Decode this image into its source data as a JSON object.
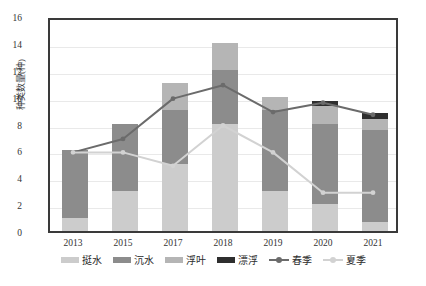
{
  "chart_data": {
    "type": "bar",
    "title": "",
    "xlabel": "",
    "ylabel": "种类数量(种)",
    "categories": [
      "2013",
      "2015",
      "2017",
      "2018",
      "2019",
      "2020",
      "2021"
    ],
    "ylim": [
      0,
      16
    ],
    "ytick_step": 2,
    "yticks": [
      "16",
      "14",
      "12",
      "10",
      "8",
      "6",
      "4",
      "2",
      "0"
    ],
    "grid": true,
    "legend_position": "bottom",
    "stacked": true,
    "series": [
      {
        "name": "挺水",
        "kind": "bar",
        "color": "#cccccc",
        "values": [
          1,
          3,
          5,
          8,
          3,
          2,
          0.7
        ]
      },
      {
        "name": "沉水",
        "kind": "bar",
        "color": "#8c8c8c",
        "values": [
          5,
          5,
          4,
          4,
          6,
          6,
          6.8
        ]
      },
      {
        "name": "浮叶",
        "kind": "bar",
        "color": "#b5b5b5",
        "values": [
          0,
          0,
          2,
          2,
          1,
          1.3,
          0.8
        ]
      },
      {
        "name": "漂浮",
        "kind": "bar",
        "color": "#2e2e2e",
        "values": [
          0,
          0,
          0,
          0,
          0,
          0.4,
          0.5
        ]
      },
      {
        "name": "春季",
        "kind": "line",
        "color": "#6b6b6b",
        "values": [
          6,
          7,
          10,
          11,
          9,
          9.7,
          8.8
        ]
      },
      {
        "name": "夏季",
        "kind": "line",
        "color": "#d2d2d2",
        "values": [
          6,
          6,
          5,
          8,
          6,
          3,
          3
        ]
      }
    ],
    "bar_totals": [
      6,
      8,
      11,
      14,
      10,
      9.7,
      8.8
    ]
  },
  "legend": {
    "items": [
      {
        "label": "挺水",
        "type": "swatch",
        "color": "#cccccc"
      },
      {
        "label": "沉水",
        "type": "swatch",
        "color": "#8c8c8c"
      },
      {
        "label": "浮叶",
        "type": "swatch",
        "color": "#b5b5b5"
      },
      {
        "label": "漂浮",
        "type": "swatch",
        "color": "#2e2e2e"
      },
      {
        "label": "春季",
        "type": "line",
        "color": "#6b6b6b"
      },
      {
        "label": "夏季",
        "type": "line",
        "color": "#d2d2d2"
      }
    ]
  },
  "colors": {
    "axis": "#3a3a3a",
    "grid": "#e9e9e9",
    "background": "#ffffff",
    "text": "#333333"
  }
}
